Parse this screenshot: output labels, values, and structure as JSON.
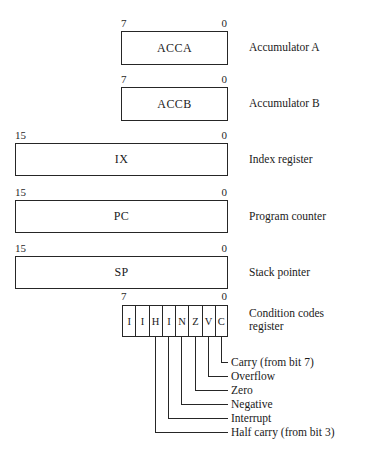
{
  "diagram": {
    "line_color": "#262626",
    "background": "#ffffff",
    "registers": [
      {
        "name": "ACCA",
        "description": "Accumulator A",
        "msb_label": "7",
        "lsb_label": "0",
        "width_bits": 8
      },
      {
        "name": "ACCB",
        "description": "Accumulator B",
        "msb_label": "7",
        "lsb_label": "0",
        "width_bits": 8
      },
      {
        "name": "IX",
        "description": "Index register",
        "msb_label": "15",
        "lsb_label": "0",
        "width_bits": 16
      },
      {
        "name": "PC",
        "description": "Program counter",
        "msb_label": "15",
        "lsb_label": "0",
        "width_bits": 16
      },
      {
        "name": "SP",
        "description": "Stack pointer",
        "msb_label": "15",
        "lsb_label": "0",
        "width_bits": 16
      }
    ],
    "condition_codes": {
      "description": "Condition codes\nregister",
      "msb_label": "7",
      "lsb_label": "0",
      "bits": [
        "I",
        "I",
        "H",
        "I",
        "N",
        "Z",
        "V",
        "C"
      ]
    },
    "flags": [
      {
        "bit": "C",
        "label": "Carry (from bit 7)"
      },
      {
        "bit": "V",
        "label": "Overflow"
      },
      {
        "bit": "Z",
        "label": "Zero"
      },
      {
        "bit": "N",
        "label": "Negative"
      },
      {
        "bit": "I",
        "label": "Interrupt"
      },
      {
        "bit": "H",
        "label": "Half carry (from bit 3)"
      }
    ]
  }
}
